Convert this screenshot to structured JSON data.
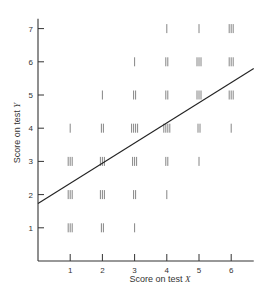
{
  "chart_data": {
    "type": "scatter",
    "subtype": "tally-scatterplot",
    "title": "",
    "xlabel": "Score on test X",
    "ylabel": "Score on test Y",
    "xticks": [
      1,
      2,
      3,
      4,
      5,
      6
    ],
    "yticks": [
      1,
      2,
      3,
      4,
      5,
      6,
      7
    ],
    "xlim": [
      0,
      6.7
    ],
    "ylim": [
      0,
      7.3
    ],
    "grid": false,
    "legend": null,
    "points": [
      {
        "x": 4,
        "y": 7,
        "count": 1
      },
      {
        "x": 5,
        "y": 7,
        "count": 1
      },
      {
        "x": 6,
        "y": 7,
        "count": 3
      },
      {
        "x": 3,
        "y": 6,
        "count": 1
      },
      {
        "x": 4,
        "y": 6,
        "count": 2
      },
      {
        "x": 5,
        "y": 6,
        "count": 3
      },
      {
        "x": 6,
        "y": 6,
        "count": 3
      },
      {
        "x": 2,
        "y": 5,
        "count": 1
      },
      {
        "x": 3,
        "y": 5,
        "count": 2
      },
      {
        "x": 4,
        "y": 5,
        "count": 2
      },
      {
        "x": 5,
        "y": 5,
        "count": 3
      },
      {
        "x": 6,
        "y": 5,
        "count": 3
      },
      {
        "x": 1,
        "y": 4,
        "count": 1
      },
      {
        "x": 2,
        "y": 4,
        "count": 2
      },
      {
        "x": 3,
        "y": 4,
        "count": 4
      },
      {
        "x": 4,
        "y": 4,
        "count": 4
      },
      {
        "x": 5,
        "y": 4,
        "count": 2
      },
      {
        "x": 6,
        "y": 4,
        "count": 1
      },
      {
        "x": 1,
        "y": 3,
        "count": 3
      },
      {
        "x": 2,
        "y": 3,
        "count": 3
      },
      {
        "x": 3,
        "y": 3,
        "count": 3
      },
      {
        "x": 4,
        "y": 3,
        "count": 2
      },
      {
        "x": 5,
        "y": 3,
        "count": 1
      },
      {
        "x": 1,
        "y": 2,
        "count": 3
      },
      {
        "x": 2,
        "y": 2,
        "count": 3
      },
      {
        "x": 3,
        "y": 2,
        "count": 2
      },
      {
        "x": 4,
        "y": 2,
        "count": 1
      },
      {
        "x": 1,
        "y": 1,
        "count": 3
      },
      {
        "x": 2,
        "y": 1,
        "count": 2
      },
      {
        "x": 3,
        "y": 1,
        "count": 1
      }
    ],
    "regression_line": {
      "x0": 0,
      "y0": 1.73,
      "x1": 6.7,
      "y1": 5.8
    }
  },
  "labels": {
    "x_prefix": "Score on test ",
    "x_var": "X",
    "y_prefix": "Score on test ",
    "y_var": "Y"
  }
}
